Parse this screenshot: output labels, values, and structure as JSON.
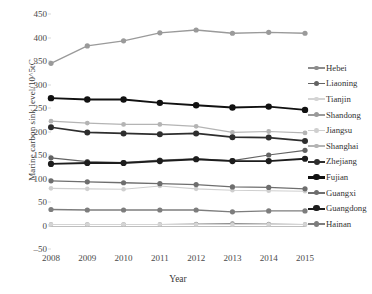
{
  "chart_data": {
    "type": "line",
    "title": "",
    "xlabel": "Year",
    "ylabel": "Marine carbon sink level/10^5tC",
    "categories": [
      "2008",
      "2009",
      "2010",
      "2011",
      "2012",
      "2013",
      "2014",
      "2015"
    ],
    "x": [
      2008,
      2009,
      2010,
      2011,
      2012,
      2013,
      2014,
      2015
    ],
    "xlim": [
      2008,
      2015
    ],
    "ylim": [
      -50,
      450
    ],
    "yticks": [
      -50,
      0,
      50,
      100,
      150,
      200,
      250,
      300,
      350,
      400,
      450
    ],
    "grid": false,
    "legend_position": "right",
    "series": [
      {
        "name": "Hebei",
        "color": "#8c8c8c",
        "width": 1.1,
        "marker": 2.3,
        "values": [
          2,
          2,
          2,
          2,
          3,
          4,
          3,
          2
        ]
      },
      {
        "name": "Liaoning",
        "color": "#636363",
        "width": 1.2,
        "marker": 2.6,
        "values": [
          144,
          136,
          134,
          139,
          142,
          138,
          150,
          160
        ]
      },
      {
        "name": "Tianjin",
        "color": "#d4d4d4",
        "width": 1.1,
        "marker": 2.3,
        "values": [
          2,
          2,
          2,
          2,
          2,
          2,
          2,
          2
        ]
      },
      {
        "name": "Shandong",
        "color": "#9a9a9a",
        "width": 1.3,
        "marker": 2.6,
        "values": [
          345,
          382,
          393,
          410,
          416,
          409,
          411,
          409
        ]
      },
      {
        "name": "Jiangsu",
        "color": "#cfcfcf",
        "width": 1.1,
        "marker": 2.3,
        "values": [
          79,
          78,
          77,
          84,
          78,
          75,
          74,
          73
        ]
      },
      {
        "name": "Shanghai",
        "color": "#b4b4b4",
        "width": 1.2,
        "marker": 2.4,
        "values": [
          222,
          218,
          215,
          215,
          211,
          198,
          200,
          197
        ]
      },
      {
        "name": "Zhejiang",
        "color": "#2e2e2e",
        "width": 1.7,
        "marker": 3.0,
        "values": [
          209,
          198,
          196,
          194,
          196,
          188,
          187,
          180
        ]
      },
      {
        "name": "Fujian",
        "color": "#111111",
        "width": 1.9,
        "marker": 3.2,
        "values": [
          271,
          268,
          268,
          261,
          256,
          251,
          253,
          246
        ]
      },
      {
        "name": "Guangxi",
        "color": "#6e6e6e",
        "width": 1.3,
        "marker": 2.6,
        "values": [
          95,
          93,
          91,
          89,
          87,
          82,
          81,
          78
        ]
      },
      {
        "name": "Guangdong",
        "color": "#1d1d1d",
        "width": 1.8,
        "marker": 3.1,
        "values": [
          131,
          133,
          133,
          137,
          141,
          137,
          137,
          142
        ]
      },
      {
        "name": "Hainan",
        "color": "#7d7d7d",
        "width": 1.3,
        "marker": 2.6,
        "values": [
          34,
          33,
          33,
          33,
          33,
          29,
          31,
          31
        ]
      }
    ]
  },
  "legend": {
    "items": [
      {
        "label": "Hebei"
      },
      {
        "label": "Liaoning"
      },
      {
        "label": "Tianjin"
      },
      {
        "label": "Shandong"
      },
      {
        "label": "Jiangsu"
      },
      {
        "label": "Shanghai"
      },
      {
        "label": "Zhejiang"
      },
      {
        "label": "Fujian"
      },
      {
        "label": "Guangxi"
      },
      {
        "label": "Guangdong"
      },
      {
        "label": "Hainan"
      }
    ]
  },
  "axes": {
    "y_title": "Marine carbon sink level/10^5tC",
    "x_title": "Year",
    "y_tick_labels": [
      "450",
      "400",
      "350",
      "300",
      "250",
      "200",
      "150",
      "100",
      "50",
      "0",
      "-50"
    ],
    "x_tick_labels": [
      "2008",
      "2009",
      "2010",
      "2011",
      "2012",
      "2013",
      "2014",
      "2015"
    ]
  }
}
